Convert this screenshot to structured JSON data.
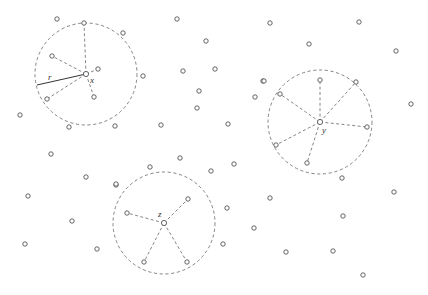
{
  "diagram": {
    "title": "",
    "colors": {
      "background": "#ffffff",
      "point_stroke": "#555555",
      "dashed": "#777777",
      "solid": "#333333",
      "label": "#333333"
    },
    "radius_label": {
      "text": "r",
      "x": 48,
      "y": 80
    },
    "neighborhoods": [
      {
        "id": "x",
        "label": "x",
        "center": [
          86,
          74
        ],
        "r": 51,
        "label_pos": [
          90,
          83
        ],
        "neighbors": [
          [
            84,
            23
          ],
          [
            52,
            56
          ],
          [
            98,
            69
          ],
          [
            94,
            97
          ],
          [
            47,
            99
          ]
        ],
        "radius_line": {
          "from": [
            86,
            74
          ],
          "to": [
            37,
            85
          ]
        }
      },
      {
        "id": "y",
        "label": "y",
        "center": [
          320,
          122
        ],
        "r": 52,
        "label_pos": [
          322,
          133
        ],
        "neighbors": [
          [
            320,
            80
          ],
          [
            280,
            94
          ],
          [
            367,
            127
          ],
          [
            276,
            145
          ],
          [
            307,
            163
          ],
          [
            356,
            82
          ]
        ]
      },
      {
        "id": "z",
        "label": "z",
        "center": [
          164,
          223
        ],
        "r": 51,
        "label_pos": [
          158,
          217
        ],
        "neighbors": [
          [
            188,
            199
          ],
          [
            127,
            213
          ],
          [
            144,
            262
          ],
          [
            187,
            262
          ]
        ]
      }
    ],
    "points": [
      [
        57,
        19
      ],
      [
        123,
        33
      ],
      [
        143,
        76
      ],
      [
        69,
        127
      ],
      [
        115,
        126
      ],
      [
        177,
        19
      ],
      [
        270,
        23
      ],
      [
        206,
        41
      ],
      [
        183,
        71
      ],
      [
        215,
        69
      ],
      [
        263,
        81
      ],
      [
        199,
        91
      ],
      [
        255,
        97
      ],
      [
        197,
        108
      ],
      [
        359,
        22
      ],
      [
        309,
        44
      ],
      [
        396,
        51
      ],
      [
        411,
        104
      ],
      [
        264,
        81
      ],
      [
        20,
        115
      ],
      [
        51,
        154
      ],
      [
        86,
        177
      ],
      [
        116,
        185
      ],
      [
        28,
        196
      ],
      [
        72,
        221
      ],
      [
        25,
        244
      ],
      [
        97,
        249
      ],
      [
        161,
        125
      ],
      [
        228,
        124
      ],
      [
        180,
        158
      ],
      [
        150,
        167
      ],
      [
        211,
        171
      ],
      [
        116,
        184
      ],
      [
        234,
        164
      ],
      [
        342,
        178
      ],
      [
        394,
        192
      ],
      [
        270,
        198
      ],
      [
        227,
        208
      ],
      [
        343,
        216
      ],
      [
        254,
        228
      ],
      [
        223,
        244
      ],
      [
        286,
        252
      ],
      [
        333,
        251
      ],
      [
        363,
        275
      ]
    ]
  }
}
